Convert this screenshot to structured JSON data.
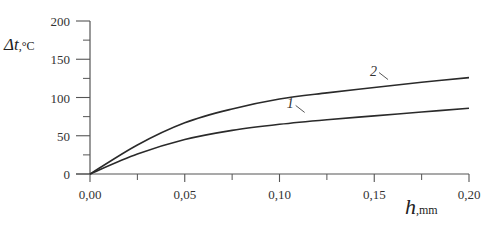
{
  "chart_data": {
    "type": "line",
    "title": "",
    "xlabel": "h, mm",
    "xlabel_symbol": "h",
    "xlabel_unit": ",mm",
    "ylabel": "Δt, °C",
    "ylabel_symbol": "Δt",
    "ylabel_unit": ",°C",
    "xlim": [
      0,
      0.2
    ],
    "ylim": [
      0,
      200
    ],
    "grid": false,
    "legend": "inline curve labels",
    "x_ticks": [
      "0,00",
      "0,05",
      "0,10",
      "0,15",
      "0,20"
    ],
    "y_ticks": [
      "0",
      "50",
      "100",
      "150",
      "200"
    ],
    "x": [
      0,
      0.025,
      0.05,
      0.075,
      0.1,
      0.125,
      0.15,
      0.175,
      0.2
    ],
    "series": [
      {
        "name": "1",
        "values": [
          0,
          26,
          45,
          57,
          65,
          71,
          76,
          81,
          86
        ]
      },
      {
        "name": "2",
        "values": [
          0,
          38,
          67,
          85,
          98,
          106,
          113,
          120,
          126
        ]
      }
    ],
    "annotations": [
      {
        "text": "1",
        "x": 0.108,
        "y": 70
      },
      {
        "text": "2",
        "x": 0.152,
        "y": 113
      }
    ]
  }
}
